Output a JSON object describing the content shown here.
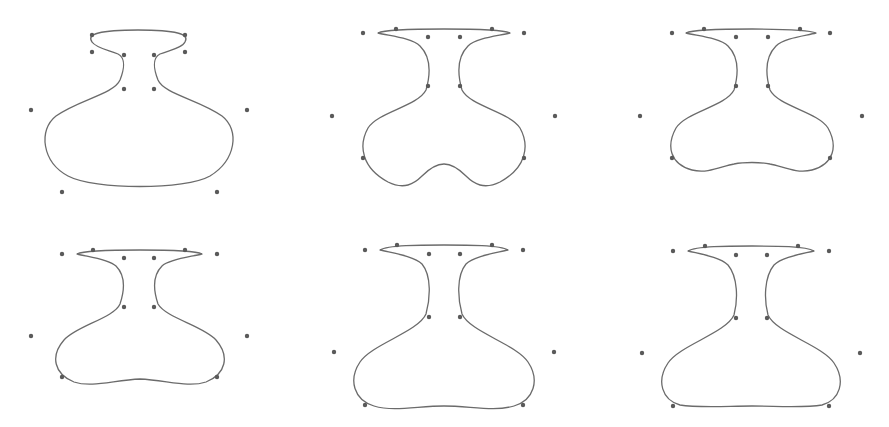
{
  "figure": {
    "width": 889,
    "height": 427,
    "colors": {
      "curve": "#6b6b6b",
      "control_point": "#5a5a5a",
      "background": "#ffffff"
    },
    "point_radius": 2.2
  },
  "vases": [
    {
      "id": "vase-1",
      "path": "M 92 42 C 86 34, 100 30, 138 30 C 176 30, 190 34, 185 42 C 182 48, 170 50, 160 54 C 152 58, 154 70, 158 80 C 164 94, 200 100, 222 116 C 240 130, 236 160, 210 176 C 186 190, 94 190, 68 176 C 42 162, 38 130, 56 116 C 78 100, 114 94, 120 80 C 124 70, 126 58, 118 54 C 108 50, 96 48, 92 42 Z",
      "points": [
        [
          92,
          35
        ],
        [
          92,
          52
        ],
        [
          124,
          55
        ],
        [
          154,
          55
        ],
        [
          185,
          35
        ],
        [
          185,
          52
        ],
        [
          124,
          89
        ],
        [
          154,
          89
        ],
        [
          31,
          110
        ],
        [
          247,
          110
        ],
        [
          62,
          192
        ],
        [
          217,
          192
        ]
      ]
    },
    {
      "id": "vase-2",
      "path": "M 378 33 C 386 29, 420 29, 444 29 C 468 29, 502 29, 510 33 C 498 36, 476 38, 468 46 C 456 58, 458 76, 462 90 C 470 106, 510 112, 520 128 C 530 146, 526 168, 500 182 C 484 190, 474 184, 466 176 C 456 166, 450 164, 444 164 C 438 164, 432 166, 422 176 C 414 184, 404 190, 388 182 C 362 168, 358 146, 368 128 C 378 112, 418 106, 426 90 C 430 76, 432 58, 420 46 C 412 38, 390 36, 378 33 Z",
      "points": [
        [
          363,
          33
        ],
        [
          396,
          29
        ],
        [
          428,
          37
        ],
        [
          460,
          37
        ],
        [
          492,
          29
        ],
        [
          524,
          33
        ],
        [
          428,
          86
        ],
        [
          460,
          86
        ],
        [
          332,
          116
        ],
        [
          555,
          116
        ],
        [
          363,
          158
        ],
        [
          524,
          158
        ]
      ]
    },
    {
      "id": "vase-3",
      "path": "M 686 33 C 694 29, 728 29, 752 29 C 776 29, 808 29, 816 33 C 804 36, 784 38, 776 46 C 764 58, 766 76, 770 90 C 778 106, 818 112, 828 128 C 838 146, 834 164, 812 170 C 796 174, 782 166, 770 164 C 760 162, 744 162, 734 164 C 722 166, 708 174, 692 170 C 670 164, 666 146, 676 128 C 686 112, 726 106, 734 90 C 738 76, 740 58, 728 46 C 720 38, 698 36, 686 33 Z",
      "points": [
        [
          672,
          33
        ],
        [
          704,
          29
        ],
        [
          736,
          37
        ],
        [
          768,
          37
        ],
        [
          800,
          29
        ],
        [
          830,
          33
        ],
        [
          736,
          86
        ],
        [
          768,
          86
        ],
        [
          640,
          116
        ],
        [
          862,
          116
        ],
        [
          672,
          158
        ],
        [
          830,
          158
        ]
      ]
    },
    {
      "id": "vase-4",
      "path": "M 77 254 C 85 250, 116 250, 140 250 C 164 250, 194 250, 202 254 C 190 257, 170 259, 162 266 C 152 276, 154 292, 158 304 C 166 318, 204 326, 216 340 C 230 356, 226 374, 206 382 C 188 388, 166 380, 140 379 C 114 380, 92 388, 74 382 C 54 374, 50 356, 64 340 C 76 326, 114 318, 120 304 C 124 292, 126 276, 116 266 C 108 259, 89 257, 77 254 Z",
      "points": [
        [
          62,
          254
        ],
        [
          93,
          250
        ],
        [
          124,
          258
        ],
        [
          154,
          258
        ],
        [
          185,
          250
        ],
        [
          217,
          254
        ],
        [
          124,
          307
        ],
        [
          154,
          307
        ],
        [
          31,
          336
        ],
        [
          247,
          336
        ],
        [
          62,
          377
        ],
        [
          217,
          377
        ]
      ]
    },
    {
      "id": "vase-5",
      "path": "M 380 250 C 388 245, 420 245, 444 245 C 468 245, 500 245, 508 250 C 496 253, 474 256, 466 264 C 456 276, 458 300, 462 314 C 470 332, 516 344, 528 362 C 540 380, 534 400, 514 406 C 494 412, 470 406, 444 406 C 418 406, 394 412, 374 406 C 354 400, 348 380, 360 362 C 372 344, 418 332, 426 314 C 430 300, 432 276, 422 264 C 414 256, 392 253, 380 250 Z",
      "points": [
        [
          365,
          250
        ],
        [
          397,
          245
        ],
        [
          429,
          254
        ],
        [
          460,
          254
        ],
        [
          492,
          245
        ],
        [
          523,
          250
        ],
        [
          429,
          317
        ],
        [
          460,
          317
        ],
        [
          334,
          352
        ],
        [
          554,
          352
        ],
        [
          365,
          405
        ],
        [
          523,
          405
        ]
      ]
    },
    {
      "id": "vase-6",
      "path": "M 688 251 C 696 246, 728 246, 752 246 C 776 246, 806 246, 814 251 C 802 254, 782 257, 774 265 C 764 277, 764 300, 768 315 C 776 333, 822 345, 834 363 C 846 381, 840 400, 822 405 C 804 408, 776 406, 752 406 C 728 406, 698 408, 680 405 C 662 400, 656 381, 668 363 C 680 345, 726 333, 734 315 C 738 300, 738 277, 728 265 C 720 257, 700 254, 688 251 Z",
      "points": [
        [
          673,
          251
        ],
        [
          705,
          246
        ],
        [
          736,
          255
        ],
        [
          767,
          255
        ],
        [
          798,
          246
        ],
        [
          829,
          251
        ],
        [
          736,
          318
        ],
        [
          767,
          318
        ],
        [
          642,
          353
        ],
        [
          860,
          353
        ],
        [
          673,
          406
        ],
        [
          829,
          406
        ]
      ]
    }
  ]
}
